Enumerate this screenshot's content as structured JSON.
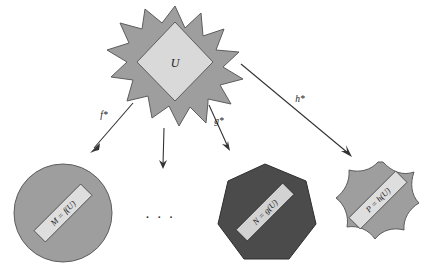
{
  "diagram": {
    "background_color": "#ffffff",
    "colors": {
      "mid_gray": "#9e9e9e",
      "light_gray": "#d9d9d9",
      "dark_gray": "#4b4b4b",
      "outline": "#5d5d5d",
      "arrow": "#333333",
      "label_box": "#dedede",
      "text": "#1a1a1a"
    },
    "source": {
      "shape": "star-burst",
      "points": 12,
      "outer_fill": "#9e9e9e",
      "inner_shape": "diamond",
      "inner_fill": "#d9d9d9",
      "label": "U"
    },
    "arrows": [
      {
        "id": "arrow-f",
        "label": "f*",
        "has_label": true,
        "target": "circle"
      },
      {
        "id": "arrow-unlabeled",
        "label": "",
        "has_label": false,
        "target": "ellipsis"
      },
      {
        "id": "arrow-g",
        "label": "g*",
        "has_label": true,
        "target": "heptagon"
      },
      {
        "id": "arrow-h",
        "label": "h*",
        "has_label": true,
        "target": "blob-star"
      }
    ],
    "targets": [
      {
        "id": "circle",
        "shape": "circle",
        "fill": "#9e9e9e",
        "label": "M = f(U)",
        "label_rotation_deg": -45
      },
      {
        "id": "heptagon",
        "shape": "heptagon",
        "fill": "#4b4b4b",
        "label": "N = g(U)",
        "label_rotation_deg": -45
      },
      {
        "id": "blob-star",
        "shape": "rounded-8-point-star",
        "fill": "#9e9e9e",
        "label": "P = h(U)",
        "label_rotation_deg": -45
      }
    ],
    "ellipsis": "· · ·"
  }
}
